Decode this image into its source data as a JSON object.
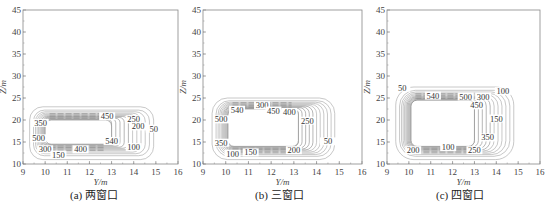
{
  "chart_data": [
    {
      "type": "contour",
      "caption": "(a) 两窗口",
      "xlabel": "Y/m",
      "ylabel": "Z/m",
      "xlim": [
        9,
        16
      ],
      "ylim": [
        10,
        45
      ],
      "xticks": [
        9,
        10,
        11,
        12,
        13,
        14,
        15,
        16
      ],
      "yticks": [
        10,
        15,
        20,
        25,
        30,
        35,
        40,
        45
      ],
      "grid": false,
      "contour_levels": [
        50,
        100,
        150,
        200,
        250,
        300,
        350,
        400,
        450,
        500,
        540
      ],
      "region": {
        "y_min": 9.3,
        "y_max": 14.9,
        "z_min": 11.0,
        "z_max": 23.0
      },
      "inner_hole": {
        "y_min": 10.0,
        "y_max": 13.0,
        "z_min": 14.5,
        "z_max": 20.0
      },
      "labels": [
        {
          "text": "350",
          "y": 9.8,
          "z": 19.0
        },
        {
          "text": "500",
          "y": 9.7,
          "z": 15.5
        },
        {
          "text": "300",
          "y": 10.0,
          "z": 13.0
        },
        {
          "text": "150",
          "y": 10.6,
          "z": 11.8
        },
        {
          "text": "400",
          "y": 11.6,
          "z": 13.0
        },
        {
          "text": "450",
          "y": 12.8,
          "z": 20.5
        },
        {
          "text": "540",
          "y": 13.0,
          "z": 14.9
        },
        {
          "text": "250",
          "y": 14.0,
          "z": 19.8
        },
        {
          "text": "200",
          "y": 14.2,
          "z": 18.2
        },
        {
          "text": "50",
          "y": 14.9,
          "z": 17.7
        },
        {
          "text": "100",
          "y": 14.0,
          "z": 13.5
        }
      ]
    },
    {
      "type": "contour",
      "caption": "(b) 三窗口",
      "xlabel": "Y/m",
      "ylabel": "Z/m",
      "xlim": [
        9,
        16
      ],
      "ylim": [
        10,
        45
      ],
      "xticks": [
        9,
        10,
        11,
        12,
        13,
        14,
        15,
        16
      ],
      "yticks": [
        10,
        15,
        20,
        25,
        30,
        35,
        40,
        45
      ],
      "grid": false,
      "contour_levels": [
        50,
        100,
        150,
        200,
        250,
        300,
        350,
        400,
        450,
        500,
        540
      ],
      "region": {
        "y_min": 9.4,
        "y_max": 14.8,
        "z_min": 11.0,
        "z_max": 25.0
      },
      "inner_hole": {
        "y_min": 10.1,
        "y_max": 13.2,
        "z_min": 14.0,
        "z_max": 22.5
      },
      "labels": [
        {
          "text": "540",
          "y": 10.5,
          "z": 22.0
        },
        {
          "text": "300",
          "y": 11.6,
          "z": 23.0
        },
        {
          "text": "450",
          "y": 12.1,
          "z": 21.8
        },
        {
          "text": "400",
          "y": 12.8,
          "z": 21.5
        },
        {
          "text": "500",
          "y": 9.8,
          "z": 19.8
        },
        {
          "text": "250",
          "y": 13.6,
          "z": 19.5
        },
        {
          "text": "350",
          "y": 9.8,
          "z": 14.5
        },
        {
          "text": "100",
          "y": 10.3,
          "z": 12.0
        },
        {
          "text": "150",
          "y": 11.1,
          "z": 12.3
        },
        {
          "text": "200",
          "y": 13.0,
          "z": 12.8
        },
        {
          "text": "50",
          "y": 14.5,
          "z": 14.8
        }
      ]
    },
    {
      "type": "contour",
      "caption": "(c) 四窗口",
      "xlabel": "Y/m",
      "ylabel": "Z/m",
      "xlim": [
        9,
        16
      ],
      "ylim": [
        10,
        45
      ],
      "xticks": [
        9,
        10,
        11,
        12,
        13,
        14,
        15,
        16
      ],
      "yticks": [
        10,
        15,
        20,
        25,
        30,
        35,
        40,
        45
      ],
      "grid": false,
      "contour_levels": [
        50,
        100,
        150,
        200,
        250,
        300,
        350,
        400,
        450,
        500,
        540
      ],
      "region": {
        "y_min": 9.4,
        "y_max": 14.8,
        "z_min": 11.0,
        "z_max": 27.5
      },
      "inner_hole": {
        "y_min": 10.1,
        "y_max": 13.0,
        "z_min": 14.0,
        "z_max": 24.5
      },
      "labels": [
        {
          "text": "50",
          "y": 9.7,
          "z": 27.0
        },
        {
          "text": "540",
          "y": 11.1,
          "z": 25.2
        },
        {
          "text": "500",
          "y": 12.6,
          "z": 25.0
        },
        {
          "text": "300",
          "y": 13.4,
          "z": 25.0
        },
        {
          "text": "100",
          "y": 14.3,
          "z": 26.2
        },
        {
          "text": "450",
          "y": 13.1,
          "z": 23.0
        },
        {
          "text": "150",
          "y": 14.0,
          "z": 20.0
        },
        {
          "text": "350",
          "y": 13.6,
          "z": 15.7
        },
        {
          "text": "200",
          "y": 10.2,
          "z": 12.8
        },
        {
          "text": "100",
          "y": 11.8,
          "z": 13.5
        },
        {
          "text": "250",
          "y": 13.0,
          "z": 12.8
        }
      ]
    }
  ],
  "panels": [
    {
      "caption": "(a) 两窗口",
      "xlabel": "Y/m",
      "ylabel": "Z/m"
    },
    {
      "caption": "(b) 三窗口",
      "xlabel": "Y/m",
      "ylabel": "Z/m"
    },
    {
      "caption": "(c) 四窗口",
      "xlabel": "Y/m",
      "ylabel": "Z/m"
    }
  ],
  "colors": {
    "axis": "#888888",
    "contour": "#9a9a9a",
    "contour_dense": "#7a7a7a",
    "text": "#333333"
  }
}
